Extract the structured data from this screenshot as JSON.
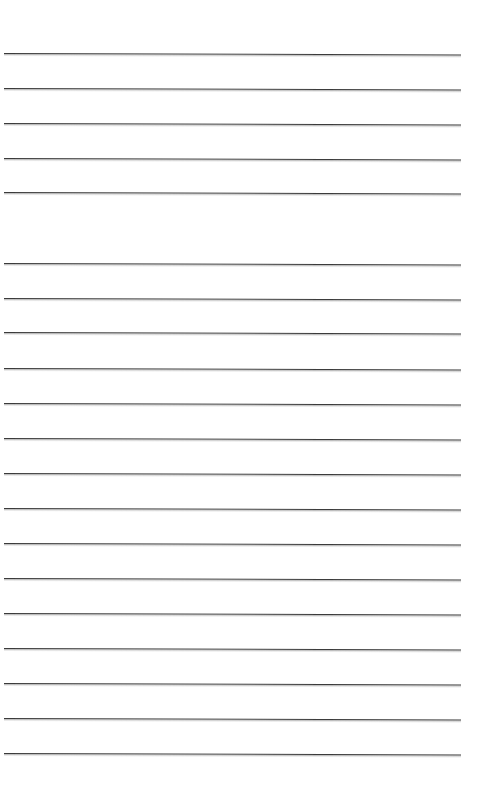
{
  "page": {
    "kind": "scanned-ruled-notebook-page",
    "width": 483,
    "height": 793,
    "background_color": "#ffffff",
    "content_text": "",
    "note": "blank lined writing paper, no handwriting or printed text present"
  },
  "rules": {
    "count": 20,
    "color": "#3b3b3b",
    "thickness_px": 1.6,
    "x_start": 4,
    "x_end": 461,
    "length_px": 457,
    "skew_deg": 0.18,
    "normal_spacing_px": 35,
    "wide_gap_after_index": 4,
    "wide_gap_px": 71,
    "y_positions": [
      53,
      88,
      123,
      158,
      192,
      263,
      298,
      332,
      368,
      403,
      438,
      473,
      508,
      543,
      578,
      613,
      648,
      683,
      718,
      753
    ]
  },
  "margins": {
    "top_px": 53,
    "left_px": 4,
    "right_px": 22,
    "bottom_px": 40
  }
}
